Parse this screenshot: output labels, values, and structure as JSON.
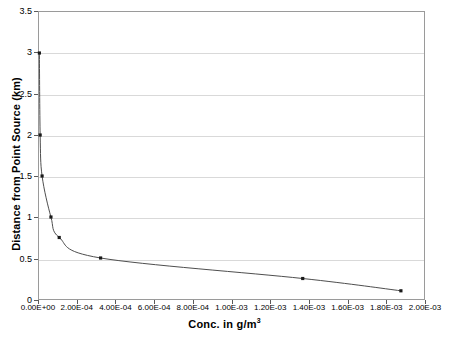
{
  "chart_data": {
    "type": "line",
    "title": "",
    "xlabel": "Conc. in g/m3",
    "xlabel_base": "Conc. in g/m",
    "xlabel_exponent": "3",
    "ylabel": "Distance from Point Source (km)",
    "xlim": [
      0,
      0.002
    ],
    "ylim": [
      0,
      3.5
    ],
    "grid": "horizontal",
    "legend": "none",
    "marker": "square",
    "line_color": "#4d4d4d",
    "marker_color": "#1a1a1a",
    "grid_color": "#d9d9d9",
    "frame_color": "#9a9a9a",
    "xticks": [
      0,
      0.0002,
      0.0004,
      0.0006,
      0.0008,
      0.001,
      0.0012,
      0.0014,
      0.0016,
      0.0018,
      0.002
    ],
    "xtick_labels": [
      "0.00E+00",
      "2.00E-04",
      "4.00E-04",
      "6.00E-04",
      "8.00E-04",
      "1.00E-03",
      "1.20E-03",
      "1.40E-03",
      "1.60E-03",
      "1.80E-03",
      "2.00E-03"
    ],
    "yticks": [
      0,
      0.5,
      1,
      1.5,
      2,
      2.5,
      3,
      3.5
    ],
    "ytick_labels": [
      "0",
      "0.5",
      "1",
      "1.5",
      "2",
      "2.5",
      "3",
      "3.5"
    ],
    "series": [
      {
        "name": "Concentration vs distance",
        "x": [
          2e-06,
          6e-06,
          1.6e-05,
          6.2e-05,
          0.000105,
          0.00032,
          0.00137,
          0.00188
        ],
        "y": [
          3.0,
          2.0,
          1.5,
          1.0,
          0.75,
          0.5,
          0.25,
          0.1
        ]
      }
    ]
  }
}
